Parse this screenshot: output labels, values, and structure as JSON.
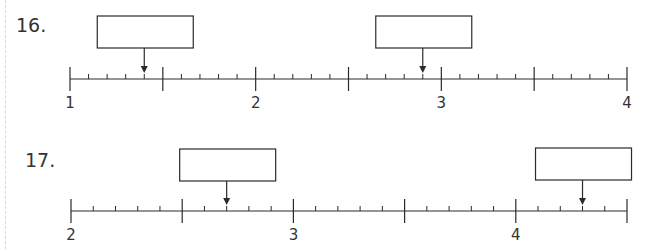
{
  "problems": [
    {
      "number": "16.",
      "axis": {
        "start": 1,
        "end": 4,
        "major_step": 0.5,
        "minor_step": 0.1,
        "labels": [
          "1",
          "2",
          "3",
          "4"
        ],
        "label_values": [
          1,
          2,
          3,
          4
        ]
      },
      "answer_boxes": [
        {
          "points_to": 1.4,
          "value": ""
        },
        {
          "points_to": 2.9,
          "value": ""
        }
      ]
    },
    {
      "number": "17.",
      "axis": {
        "start": 2,
        "end": 4.5,
        "major_step": 0.5,
        "minor_step": 0.1,
        "labels": [
          "2",
          "3",
          "4"
        ],
        "label_values": [
          2,
          3,
          4
        ]
      },
      "answer_boxes": [
        {
          "points_to": 2.7,
          "value": ""
        },
        {
          "points_to": 4.3,
          "value": ""
        }
      ]
    }
  ],
  "colors": {
    "ink": "#2a2a2a",
    "background": "#ffffff",
    "margin_dash": "#d8d8d8"
  }
}
